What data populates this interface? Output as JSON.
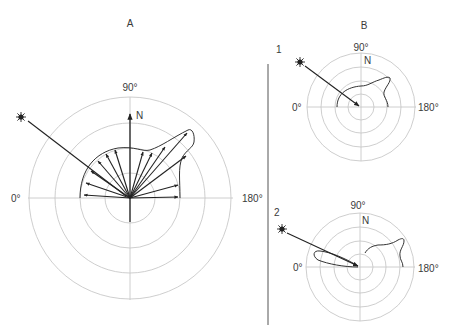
{
  "panel_a": {
    "title": "A",
    "label_90": "90°",
    "label_0": "0°",
    "label_180": "180°",
    "label_n": "N",
    "icon": "sun-icon"
  },
  "panel_b": {
    "title": "B",
    "sub1": {
      "label": "1",
      "label_90": "90°",
      "label_0": "0°",
      "label_180": "180°",
      "label_n": "N",
      "icon": "sun-icon"
    },
    "sub2": {
      "label": "2",
      "label_90": "90°",
      "label_0": "0°",
      "label_180": "180°",
      "label_n": "N",
      "icon": "sun-icon"
    }
  },
  "colors": {
    "grid": "#c8c8c8",
    "ink": "#222222",
    "text": "#3a3a3a"
  }
}
